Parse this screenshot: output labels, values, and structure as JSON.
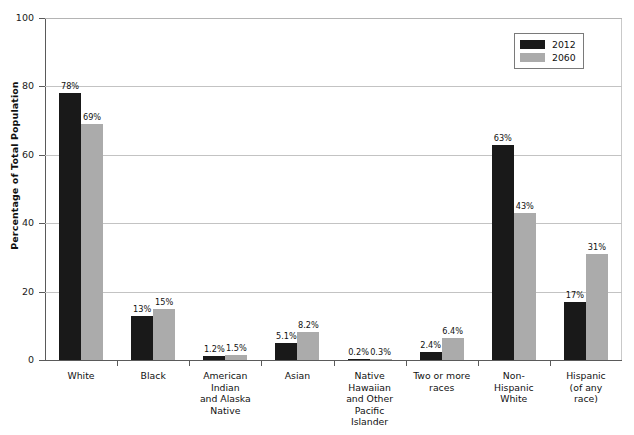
{
  "chart_data": {
    "type": "bar",
    "title": "",
    "xlabel": "",
    "ylabel": "Percentage of Total Population",
    "ylim": [
      0,
      100
    ],
    "yticks": [
      0,
      20,
      40,
      60,
      80,
      100
    ],
    "grid": true,
    "legend_position": "top-right",
    "categories": [
      "White",
      "Black",
      "American Indian and Alaska Native",
      "Asian",
      "Native Hawaiian and Other Pacific Islander",
      "Two or more races",
      "Non-Hispanic White",
      "Hispanic (of any race)"
    ],
    "category_label_lines": [
      [
        "White"
      ],
      [
        "Black"
      ],
      [
        "American",
        "Indian",
        "and Alaska",
        "Native"
      ],
      [
        "Asian"
      ],
      [
        "Native",
        "Hawaiian",
        "and Other",
        "Pacific",
        "Islander"
      ],
      [
        "Two or more",
        "races"
      ],
      [
        "Non-",
        "Hispanic",
        "White"
      ],
      [
        "Hispanic",
        "(of any",
        "race)"
      ]
    ],
    "series": [
      {
        "name": "2012",
        "color": "#191919",
        "values": [
          78,
          13,
          1.2,
          5.1,
          0.2,
          2.4,
          63,
          17
        ],
        "labels": [
          "78%",
          "13%",
          "1.2%",
          "5.1%",
          "0.2%",
          "2.4%",
          "63%",
          "17%"
        ]
      },
      {
        "name": "2060",
        "color": "#ababab",
        "values": [
          69,
          15,
          1.5,
          8.2,
          0.3,
          6.4,
          43,
          31
        ],
        "labels": [
          "69%",
          "15%",
          "1.5%",
          "8.2%",
          "0.3%",
          "6.4%",
          "43%",
          "31%"
        ]
      }
    ]
  },
  "axis": {
    "ytick_labels": [
      "0",
      "20",
      "40",
      "60",
      "80",
      "100"
    ]
  },
  "legend": {
    "entries": [
      {
        "label": "2012"
      },
      {
        "label": "2060"
      }
    ]
  }
}
